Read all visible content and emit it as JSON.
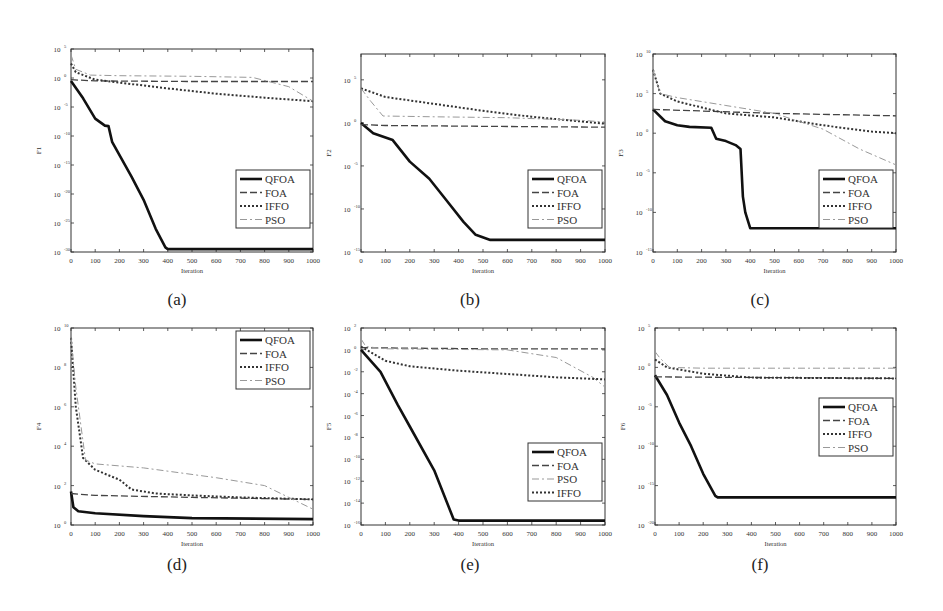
{
  "figure": {
    "panels_layout": "2 rows x 3 columns",
    "captions": [
      "(a)",
      "(b)",
      "(c)",
      "(d)",
      "(e)",
      "(f)"
    ]
  },
  "chart_data": [
    {
      "id": "a",
      "caption": "(a)",
      "type": "line",
      "yscale": "log",
      "title": "",
      "xlabel": "Iteration",
      "ylabel": "F1",
      "xlim": [
        0,
        1000
      ],
      "xticks": [
        0,
        100,
        200,
        300,
        400,
        500,
        600,
        700,
        800,
        900,
        1000
      ],
      "ylim_exp": [
        -30,
        5
      ],
      "yticks_exp": [
        5,
        0,
        -5,
        -10,
        -15,
        -20,
        -25,
        -30
      ],
      "grid": false,
      "legend_position": "lower right",
      "legend": [
        "QFOA",
        "FOA",
        "IFFO",
        "PSO"
      ],
      "series": [
        {
          "name": "QFOA",
          "style": "solid",
          "x": [
            0,
            50,
            100,
            140,
            155,
            170,
            250,
            300,
            350,
            390,
            400,
            1000
          ],
          "log10_y": [
            -0.5,
            -3.5,
            -7,
            -8.2,
            -8.3,
            -11,
            -17,
            -21,
            -26,
            -29.2,
            -29.5,
            -29.5
          ]
        },
        {
          "name": "FOA",
          "style": "dashed",
          "x": [
            0,
            100,
            500,
            1000
          ],
          "log10_y": [
            -0.3,
            -0.5,
            -0.6,
            -0.6
          ]
        },
        {
          "name": "IFFO",
          "style": "dotted",
          "x": [
            0,
            20,
            100,
            200,
            400,
            600,
            800,
            1000
          ],
          "log10_y": [
            2.5,
            1,
            -0.3,
            -0.8,
            -1.8,
            -2.7,
            -3.4,
            -4
          ]
        },
        {
          "name": "PSO",
          "style": "dashdot",
          "x": [
            0,
            20,
            80,
            200,
            500,
            750,
            900,
            1000
          ],
          "log10_y": [
            4,
            1.5,
            0.5,
            0.4,
            0.3,
            0.1,
            -1.5,
            -4
          ]
        }
      ]
    },
    {
      "id": "b",
      "caption": "(b)",
      "type": "line",
      "yscale": "log",
      "title": "",
      "xlabel": "Iteration",
      "ylabel": "F2",
      "xlim": [
        0,
        1000
      ],
      "xticks": [
        0,
        100,
        200,
        300,
        400,
        500,
        600,
        700,
        800,
        900,
        1000
      ],
      "ylim_exp": [
        -15,
        8
      ],
      "yticks_exp": [
        5,
        0,
        -5,
        -10,
        -15
      ],
      "grid": false,
      "legend_position": "lower right",
      "legend": [
        "QFOA",
        "FOA",
        "IFFO",
        "PSO"
      ],
      "series": [
        {
          "name": "QFOA",
          "style": "solid",
          "x": [
            0,
            50,
            130,
            200,
            280,
            350,
            420,
            470,
            530,
            1000
          ],
          "log10_y": [
            0,
            -1.2,
            -2,
            -4.5,
            -6.5,
            -9,
            -11.5,
            -13,
            -13.6,
            -13.6
          ]
        },
        {
          "name": "FOA",
          "style": "dashed",
          "x": [
            0,
            100,
            500,
            1000
          ],
          "log10_y": [
            -0.2,
            -0.3,
            -0.4,
            -0.5
          ]
        },
        {
          "name": "IFFO",
          "style": "dotted",
          "x": [
            0,
            100,
            300,
            500,
            700,
            1000
          ],
          "log10_y": [
            4,
            3,
            2.2,
            1.4,
            0.7,
            -0.1
          ]
        },
        {
          "name": "PSO",
          "style": "dashdot",
          "x": [
            0,
            40,
            90,
            300,
            600,
            900,
            1000
          ],
          "log10_y": [
            4,
            2.5,
            0.8,
            0.7,
            0.6,
            0.3,
            0.1
          ]
        }
      ]
    },
    {
      "id": "c",
      "caption": "(c)",
      "type": "line",
      "yscale": "log",
      "title": "",
      "xlabel": "Iteration",
      "ylabel": "F3",
      "xlim": [
        0,
        1000
      ],
      "xticks": [
        0,
        100,
        200,
        300,
        400,
        500,
        600,
        700,
        800,
        900,
        1000
      ],
      "ylim_exp": [
        -15,
        10
      ],
      "yticks_exp": [
        10,
        5,
        0,
        -5,
        -10,
        -15
      ],
      "grid": false,
      "legend_position": "lower right",
      "legend": [
        "QFOA",
        "FOA",
        "IFFO",
        "PSO"
      ],
      "series": [
        {
          "name": "QFOA",
          "style": "solid",
          "x": [
            0,
            50,
            100,
            150,
            240,
            260,
            300,
            340,
            360,
            370,
            380,
            400,
            1000
          ],
          "log10_y": [
            3,
            1.5,
            1,
            0.8,
            0.7,
            -0.7,
            -1,
            -1.5,
            -2,
            -8,
            -10,
            -12,
            -12
          ]
        },
        {
          "name": "FOA",
          "style": "dashed",
          "x": [
            0,
            200,
            500,
            1000
          ],
          "log10_y": [
            3,
            2.8,
            2.5,
            2.2
          ]
        },
        {
          "name": "IFFO",
          "style": "dotted",
          "x": [
            0,
            30,
            100,
            300,
            500,
            700,
            900,
            1000
          ],
          "log10_y": [
            8,
            5,
            4,
            2.5,
            2,
            1,
            0.2,
            0
          ]
        },
        {
          "name": "PSO",
          "style": "dashdot",
          "x": [
            0,
            30,
            100,
            300,
            500,
            700,
            850,
            1000
          ],
          "log10_y": [
            8,
            5,
            4.5,
            3.5,
            2.5,
            0.5,
            -2,
            -4
          ]
        }
      ]
    },
    {
      "id": "d",
      "caption": "(d)",
      "type": "line",
      "yscale": "log",
      "title": "",
      "xlabel": "Iteration",
      "ylabel": "F4",
      "xlim": [
        0,
        1000
      ],
      "xticks": [
        0,
        100,
        200,
        300,
        400,
        500,
        600,
        700,
        800,
        900,
        1000
      ],
      "ylim_exp": [
        0,
        10
      ],
      "yticks_exp": [
        10,
        8,
        6,
        4,
        2,
        0
      ],
      "grid": false,
      "legend_position": "upper right",
      "legend": [
        "QFOA",
        "FOA",
        "IFFO",
        "PSO"
      ],
      "series": [
        {
          "name": "QFOA",
          "style": "solid",
          "x": [
            0,
            10,
            30,
            100,
            300,
            500,
            1000
          ],
          "log10_y": [
            1.7,
            0.9,
            0.7,
            0.6,
            0.45,
            0.35,
            0.3
          ]
        },
        {
          "name": "FOA",
          "style": "dashed",
          "x": [
            0,
            100,
            500,
            1000
          ],
          "log10_y": [
            1.6,
            1.5,
            1.4,
            1.3
          ]
        },
        {
          "name": "IFFO",
          "style": "dotted",
          "x": [
            0,
            20,
            50,
            100,
            200,
            250,
            350,
            500,
            700,
            1000
          ],
          "log10_y": [
            9.5,
            6,
            3.4,
            2.8,
            2.3,
            1.8,
            1.6,
            1.5,
            1.4,
            1.3
          ]
        },
        {
          "name": "PSO",
          "style": "dashdot",
          "x": [
            0,
            20,
            60,
            100,
            300,
            600,
            800,
            1000
          ],
          "log10_y": [
            9.5,
            7,
            3.3,
            3.1,
            2.9,
            2.4,
            2,
            0.8
          ]
        }
      ]
    },
    {
      "id": "e",
      "caption": "(e)",
      "type": "line",
      "yscale": "log",
      "title": "",
      "xlabel": "Iteration",
      "ylabel": "F5",
      "xlim": [
        0,
        1000
      ],
      "xticks": [
        0,
        100,
        200,
        300,
        400,
        500,
        600,
        700,
        800,
        900,
        1000
      ],
      "ylim_exp": [
        -16,
        2
      ],
      "yticks_exp": [
        2,
        0,
        -2,
        -4,
        -6,
        -8,
        -10,
        -12,
        -14,
        -16
      ],
      "grid": false,
      "legend_position": "lower right",
      "legend": [
        "QFOA",
        "FOA",
        "PSO",
        "IFFO"
      ],
      "series": [
        {
          "name": "QFOA",
          "style": "solid",
          "x": [
            0,
            80,
            150,
            200,
            300,
            380,
            400,
            1000
          ],
          "log10_y": [
            0,
            -2,
            -5,
            -7,
            -11,
            -15.5,
            -15.6,
            -15.6
          ]
        },
        {
          "name": "FOA",
          "style": "dashed",
          "x": [
            0,
            500,
            1000
          ],
          "log10_y": [
            0.2,
            0.1,
            0.1
          ]
        },
        {
          "name": "PSO",
          "style": "dashdot",
          "x": [
            0,
            20,
            100,
            600,
            800,
            950,
            1000
          ],
          "log10_y": [
            1,
            0.3,
            0.1,
            0,
            -0.7,
            -2.5,
            -3.4
          ]
        },
        {
          "name": "IFFO",
          "style": "dotted",
          "x": [
            0,
            100,
            200,
            400,
            600,
            800,
            1000
          ],
          "log10_y": [
            0.3,
            -1,
            -1.5,
            -1.9,
            -2.2,
            -2.5,
            -2.7
          ]
        }
      ]
    },
    {
      "id": "f",
      "caption": "(f)",
      "type": "line",
      "yscale": "log",
      "title": "",
      "xlabel": "Iteration",
      "ylabel": "F6",
      "xlim": [
        0,
        1000
      ],
      "xticks": [
        0,
        100,
        200,
        300,
        400,
        500,
        600,
        700,
        800,
        900,
        1000
      ],
      "ylim_exp": [
        -20,
        5
      ],
      "yticks_exp": [
        5,
        0,
        -5,
        -10,
        -15,
        -20
      ],
      "grid": false,
      "legend_position": "center right",
      "legend": [
        "QFOA",
        "FOA",
        "IFFO",
        "PSO"
      ],
      "series": [
        {
          "name": "QFOA",
          "style": "solid",
          "x": [
            0,
            50,
            100,
            150,
            200,
            250,
            260,
            1000
          ],
          "log10_y": [
            -1,
            -3.5,
            -7,
            -10,
            -13.5,
            -16.3,
            -16.5,
            -16.5
          ]
        },
        {
          "name": "FOA",
          "style": "dashed",
          "x": [
            0,
            500,
            1000
          ],
          "log10_y": [
            -1.2,
            -1.3,
            -1.4
          ]
        },
        {
          "name": "IFFO",
          "style": "dotted",
          "x": [
            0,
            50,
            200,
            400,
            1000
          ],
          "log10_y": [
            1,
            0,
            -0.8,
            -1.3,
            -1.4
          ]
        },
        {
          "name": "PSO",
          "style": "dashdot",
          "x": [
            0,
            20,
            60,
            200,
            1000
          ],
          "log10_y": [
            2,
            1.2,
            0,
            -0.1,
            -0.1
          ]
        }
      ]
    }
  ]
}
